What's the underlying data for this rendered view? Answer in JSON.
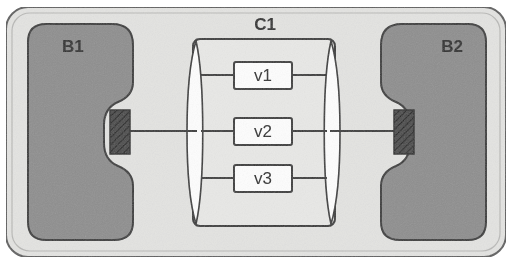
{
  "figure": {
    "type": "block-diagram",
    "background_color": "#ffffff"
  },
  "outer_frame": {
    "name": "outer-enclosure",
    "fill": "#e3e3e1",
    "stroke": "#5a5a5a",
    "x": 6,
    "y": 7,
    "width": 500,
    "height": 250,
    "radius": 22
  },
  "blocks": [
    {
      "id": "B1",
      "label": "B1",
      "fill": "#8e8e8e",
      "stroke": "#3a3a3a",
      "label_x": 62,
      "label_y": 52,
      "side": "left"
    },
    {
      "id": "B2",
      "label": "B2",
      "fill": "#8e8e8e",
      "stroke": "#3a3a3a",
      "label_x": 452,
      "label_y": 52,
      "side": "right"
    }
  ],
  "component": {
    "id": "C1",
    "label": "C1",
    "label_x": 265,
    "label_y": 26,
    "fill": "#e3e3e1",
    "stroke": "#3a3a3a",
    "x": 193,
    "y": 39,
    "width": 142,
    "height": 187
  },
  "bus_bars": [
    {
      "id": "left-bus",
      "name": "bus-bar-left",
      "fill": "#fdfdfd",
      "stroke": "#3a3a3a",
      "cx": 200
    },
    {
      "id": "right-bus",
      "name": "bus-bar-right",
      "fill": "#fdfdfd",
      "stroke": "#3a3a3a",
      "cx": 328
    }
  ],
  "nodes": [
    {
      "id": "v1",
      "label": "v1",
      "x": 234,
      "y": 62,
      "width": 58,
      "height": 27,
      "fill": "#fdfdfd",
      "stroke": "#3a3a3a"
    },
    {
      "id": "v2",
      "label": "v2",
      "x": 234,
      "y": 118,
      "width": 58,
      "height": 27,
      "fill": "#fdfdfd",
      "stroke": "#3a3a3a"
    },
    {
      "id": "v3",
      "label": "v3",
      "x": 234,
      "y": 165,
      "width": 58,
      "height": 27,
      "fill": "#fdfdfd",
      "stroke": "#3a3a3a"
    }
  ],
  "terminals": [
    {
      "id": "terminal-left",
      "name": "hatched-terminal-left",
      "x": 110,
      "y": 110,
      "width": 20,
      "height": 44,
      "fill": "#3b3b3b"
    },
    {
      "id": "terminal-right",
      "name": "hatched-terminal-right",
      "x": 394,
      "y": 110,
      "width": 20,
      "height": 44,
      "fill": "#3b3b3b"
    }
  ],
  "connectors": [
    {
      "id": "conn-left",
      "name": "connector-left",
      "x1": 130,
      "y1": 131,
      "x2": 200,
      "y2": 131
    },
    {
      "id": "conn-right",
      "name": "connector-right",
      "x1": 328,
      "y1": 131,
      "x2": 394,
      "y2": 131
    }
  ],
  "colors": {
    "block_gray": "#8e8e8e",
    "frame_gray": "#e3e3e1",
    "line_dark": "#3a3a3a",
    "white": "#fdfdfd",
    "hatch_dark": "#3b3b3b"
  }
}
